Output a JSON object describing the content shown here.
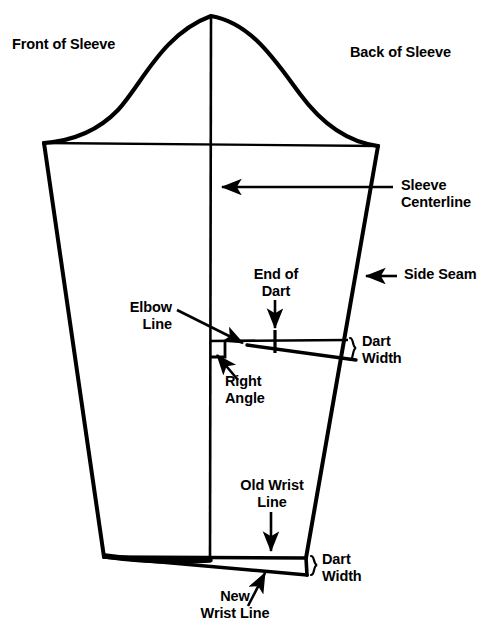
{
  "diagram": {
    "type": "sewing-pattern",
    "stroke_color": "#000000",
    "background_color": "#ffffff"
  },
  "labels": {
    "front_of_sleeve": "Front of Sleeve",
    "back_of_sleeve": "Back of Sleeve",
    "sleeve_centerline": "Sleeve\nCenterline",
    "side_seam": "Side Seam",
    "end_of_dart": "End of\nDart",
    "elbow_line": "Elbow\nLine",
    "right_angle": "Right\nAngle",
    "dart_width_elbow": "Dart\nWidth",
    "old_wrist_line": "Old Wrist\nLine",
    "dart_width_wrist": "Dart\nWidth",
    "new_wrist_line": "New\nWrist Line"
  },
  "geometry": {
    "cap_apex": [
      211,
      16
    ],
    "bicep_left": [
      44,
      143
    ],
    "bicep_right": [
      378,
      146
    ],
    "hem_left": [
      104,
      557
    ],
    "hem_right_old": [
      306,
      558
    ],
    "hem_right_new": [
      307,
      575
    ],
    "centerline_x": 210,
    "elbow_line_y": 341,
    "dart_tick_x": 275
  },
  "annotations": {
    "sleeve_centerline_arrow": {
      "from": [
        393,
        187
      ],
      "to": [
        218,
        187
      ]
    },
    "side_seam_arrow": {
      "from": [
        395,
        276
      ],
      "to": [
        364,
        276
      ]
    },
    "end_of_dart_arrow": {
      "from": [
        275,
        300
      ],
      "to": [
        275,
        331
      ]
    },
    "elbow_line_arrow": {
      "from": [
        178,
        311
      ],
      "to": [
        244,
        344
      ]
    },
    "right_angle_arrow": {
      "from": [
        237,
        379
      ],
      "to": [
        216,
        354
      ]
    },
    "old_wrist_line_arrow": {
      "from": [
        271,
        513
      ],
      "to": [
        271,
        553
      ]
    },
    "new_wrist_line_arrow": {
      "from": [
        249,
        605
      ],
      "to": [
        264,
        573
      ]
    }
  }
}
